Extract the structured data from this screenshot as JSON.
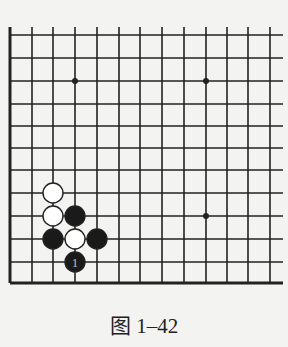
{
  "figure": {
    "caption": "图 1–42",
    "colors": {
      "line": "#222222",
      "black_stone": "#1a1a1a",
      "white_stone": "#ffffff",
      "background": "#f3f3f1"
    }
  },
  "board": {
    "columns_x": [
      10,
      32,
      53,
      75,
      97,
      119,
      140,
      162,
      184,
      206,
      227,
      248,
      270
    ],
    "rows_y": [
      35,
      58,
      81,
      104,
      126,
      148,
      170,
      193,
      216,
      239,
      262,
      283
    ],
    "open_top_extend": 8,
    "open_right_extend": 13,
    "bottom_edge_thick": true,
    "left_edge_thick": true,
    "star_points": [
      {
        "col": 3,
        "row": 2
      },
      {
        "col": 9,
        "row": 2
      },
      {
        "col": 9,
        "row": 8
      }
    ],
    "stone_radius": 10,
    "stones": [
      {
        "color": "white",
        "col": 2,
        "row": 7,
        "label": ""
      },
      {
        "color": "white",
        "col": 2,
        "row": 8,
        "label": ""
      },
      {
        "color": "black",
        "col": 3,
        "row": 8,
        "label": ""
      },
      {
        "color": "black",
        "col": 2,
        "row": 9,
        "label": ""
      },
      {
        "color": "white",
        "col": 3,
        "row": 9,
        "label": ""
      },
      {
        "color": "black",
        "col": 4,
        "row": 9,
        "label": ""
      },
      {
        "color": "black",
        "col": 3,
        "row": 10,
        "label": "1"
      }
    ]
  }
}
